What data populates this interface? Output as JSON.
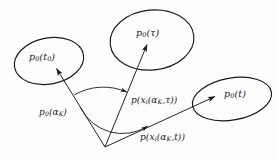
{
  "figure": {
    "type": "vector-diagram",
    "background_color": "#fdfdfd",
    "stroke_color": "#1a1a1a",
    "vertex": {
      "x": 105,
      "y": 147
    },
    "sets": [
      {
        "id": "set-t0",
        "label_html": "p<sub>0</sub>(t<sub>0</sub>)",
        "center": {
          "x": 49,
          "y": 61
        },
        "rx": 35,
        "ry": 23,
        "rotation_deg": -11,
        "label_x": 29,
        "label_y": 52
      },
      {
        "id": "set-tau",
        "label_html": "p<sub>0</sub>(τ)",
        "center": {
          "x": 152,
          "y": 40
        },
        "rx": 42,
        "ry": 30,
        "rotation_deg": -6,
        "label_x": 136,
        "label_y": 28
      },
      {
        "id": "set-t",
        "label_html": "p<sub>0</sub>(t)",
        "center": {
          "x": 232,
          "y": 99
        },
        "rx": 40,
        "ry": 21,
        "rotation_deg": -10,
        "label_x": 224,
        "label_y": 89
      }
    ],
    "arrows": [
      {
        "id": "arrow-to-t0",
        "from": {
          "x": 105,
          "y": 147
        },
        "to": {
          "x": 55,
          "y": 66
        },
        "label_html": "p<sub>0</sub>(α<sub>K</sub>)",
        "label_x": 39,
        "label_y": 108
      },
      {
        "id": "arrow-to-tau",
        "from": {
          "x": 105,
          "y": 147
        },
        "to": {
          "x": 148,
          "y": 42
        },
        "label_html": "p(x<sub>i</sub>(α<sub>K</sub>,τ))",
        "label_x": 131,
        "label_y": 96
      },
      {
        "id": "arrow-to-t",
        "from": {
          "x": 105,
          "y": 147
        },
        "to": {
          "x": 218,
          "y": 95
        },
        "label_html": "p(x<sub>i</sub>(α<sub>K</sub>,t))",
        "label_x": 140,
        "label_y": 133
      }
    ],
    "angle_arcs": [
      {
        "id": "angle-arc-tau",
        "radius": 58,
        "start_deg": 238,
        "end_deg": 292
      },
      {
        "id": "angle-arc-t",
        "radius": 47,
        "start_deg": 238,
        "end_deg": 335
      }
    ]
  }
}
